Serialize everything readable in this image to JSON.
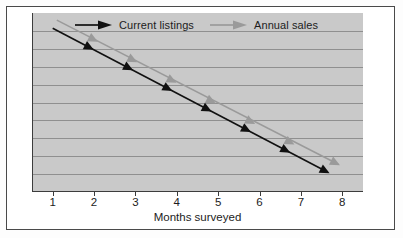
{
  "chart_data": {
    "type": "line",
    "title": "",
    "xlabel": "Months surveyed",
    "ylabel": "",
    "xlim": [
      0.5,
      8.5
    ],
    "ylim": [
      0,
      10
    ],
    "xticks": [
      1,
      2,
      3,
      4,
      5,
      6,
      7,
      8
    ],
    "xtick_labels": [
      "1",
      "2",
      "3",
      "4",
      "5",
      "6",
      "7",
      "8"
    ],
    "ytick_labels": [],
    "grid": "horizontal",
    "gridline_count": 9,
    "legend_position": "top-inside",
    "series": [
      {
        "name": "Current listings",
        "color": "#111111",
        "marker": "arrow-right",
        "x": [
          1.0,
          1.95,
          2.9,
          3.85,
          4.8,
          5.75,
          6.7,
          7.65
        ],
        "y": [
          9.15,
          8.0,
          6.85,
          5.7,
          4.55,
          3.4,
          2.25,
          1.1
        ]
      },
      {
        "name": "Annual sales",
        "color": "#9a9a9a",
        "marker": "arrow-right",
        "x": [
          1.1,
          2.05,
          3.0,
          3.95,
          4.9,
          5.85,
          6.8,
          7.9
        ],
        "y": [
          9.6,
          8.45,
          7.3,
          6.15,
          5.0,
          3.85,
          2.7,
          1.55
        ]
      }
    ]
  },
  "legend": {
    "entries": [
      {
        "label": "Current listings",
        "color": "#111111"
      },
      {
        "label": "Annual sales",
        "color": "#9a9a9a"
      }
    ]
  },
  "axis": {
    "x_title": "Months surveyed",
    "x_labels": [
      "1",
      "2",
      "3",
      "4",
      "5",
      "6",
      "7",
      "8"
    ]
  },
  "colors": {
    "plot_background": "#c9c9c9",
    "gridline": "#8f8f8f",
    "spine": "#3c3c3c",
    "frame": "#4a4a4a",
    "page_background": "#ffffff",
    "series_primary": "#111111",
    "series_secondary": "#9a9a9a"
  }
}
